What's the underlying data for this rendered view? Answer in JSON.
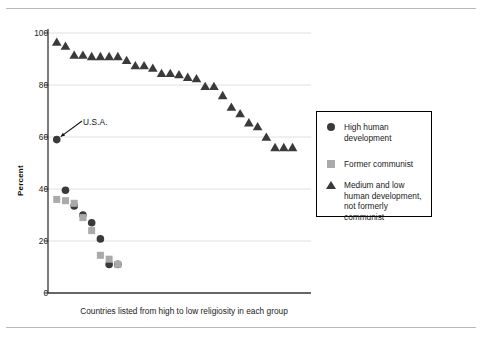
{
  "figure": {
    "background": "#ffffff",
    "rule_color": "#b8b8b8",
    "axis_color": "#333333",
    "grid_color": "#d8d8d8"
  },
  "annotation": {
    "usa_label": "U.S.A."
  },
  "legend": {
    "position": "right",
    "items": [
      {
        "marker": "circle-marker",
        "label": "High human development",
        "color": "#3a3a3a"
      },
      {
        "marker": "square-marker",
        "label": "Former communist",
        "color": "#aaaaaa"
      },
      {
        "marker": "triangle-marker",
        "label": "Medium and low human development, not formerly communist",
        "color": "#3a3a3a"
      }
    ]
  },
  "chart_data": {
    "type": "scatter",
    "title": "",
    "subtitle": "",
    "xlabel": "Countries listed from high to low religiosity in each group",
    "ylabel": "Percent",
    "ylim": [
      0,
      100
    ],
    "yticks": [
      0,
      20,
      40,
      60,
      80,
      100
    ],
    "ytick_labels": [
      "0",
      "20",
      "40",
      "60",
      "80",
      "100"
    ],
    "xlim": [
      0,
      30
    ],
    "xticks": [],
    "xtick_labels": [],
    "grid": "horizontal",
    "legend_position": "right",
    "annotations": [
      {
        "text": "U.S.A.",
        "x": 1,
        "y": 59,
        "arrow": true
      }
    ],
    "series": [
      {
        "name": "High human development",
        "marker": "circle",
        "color": "#3a3a3a",
        "x": [
          1,
          2,
          3,
          4,
          5,
          6,
          7,
          8
        ],
        "values": [
          59,
          39.5,
          33.5,
          30,
          27,
          20.8,
          11,
          11
        ]
      },
      {
        "name": "Former communist",
        "marker": "square",
        "color": "#aaaaaa",
        "x": [
          1,
          2,
          3,
          4,
          5,
          6,
          7,
          8
        ],
        "values": [
          36,
          35.5,
          34.5,
          29,
          24,
          14.5,
          13,
          11
        ]
      },
      {
        "name": "Medium and low human development, not formerly communist",
        "marker": "triangle",
        "color": "#3a3a3a",
        "x": [
          1,
          2,
          3,
          4,
          5,
          6,
          7,
          8,
          9,
          10,
          11,
          12,
          13,
          14,
          15,
          16,
          17,
          18,
          19,
          20,
          21,
          22,
          23,
          24,
          25,
          26,
          27,
          28
        ],
        "values": [
          96.5,
          95,
          91.5,
          91.5,
          91,
          91,
          91,
          91,
          89.5,
          87.5,
          87.5,
          86.5,
          84.5,
          84.5,
          84,
          83,
          82.5,
          79.5,
          79.5,
          76,
          71.5,
          69,
          65.5,
          64,
          60,
          56,
          56,
          56
        ]
      }
    ]
  }
}
